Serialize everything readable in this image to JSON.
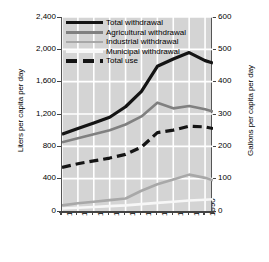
{
  "chart_data": {
    "type": "line",
    "title": "",
    "xlabel": "",
    "ylabel": "Liters per capita per day",
    "ylabel_right": "Gallons per capita per day",
    "x": [
      1900,
      1910,
      1920,
      1930,
      1940,
      1950,
      1960,
      1970,
      1980,
      1990,
      1995
    ],
    "xlim": [
      1900,
      1995
    ],
    "ylim": [
      0,
      2400
    ],
    "ylim_right": [
      0,
      600
    ],
    "xticks": [
      "1900",
      "1910",
      "1920",
      "1930",
      "1940",
      "1950",
      "1960",
      "1970",
      "1980",
      "1990"
    ],
    "yticks_left": [
      "0",
      "400",
      "800",
      "1,200",
      "1,600",
      "2,000",
      "2,400"
    ],
    "yticks_right": [
      "0",
      "100",
      "200",
      "300",
      "400",
      "500",
      "600"
    ],
    "grid": true,
    "grid_color": "#ffffff",
    "plot_background": "#d4d4d4",
    "legend_position": "top-left",
    "series": [
      {
        "name": "Total withdrawal",
        "color": "#141414",
        "style": "solid",
        "width": 3.2,
        "values": [
          950,
          1020,
          1090,
          1160,
          1290,
          1480,
          1790,
          1880,
          1960,
          1860,
          1830
        ]
      },
      {
        "name": "Agricultural withdrawal",
        "color": "#808080",
        "style": "solid",
        "width": 2.6,
        "values": [
          850,
          900,
          950,
          1000,
          1070,
          1170,
          1340,
          1270,
          1300,
          1260,
          1230
        ]
      },
      {
        "name": "Industrial withdrawal",
        "color": "#a8a8a8",
        "style": "solid",
        "width": 2.6,
        "values": [
          70,
          95,
          115,
          135,
          155,
          250,
          330,
          390,
          450,
          410,
          380
        ]
      },
      {
        "name": "Municipal withdrawal",
        "color": "#f7f7f7",
        "style": "solid",
        "width": 2.6,
        "values": [
          30,
          40,
          50,
          60,
          70,
          85,
          100,
          115,
          130,
          140,
          145
        ]
      },
      {
        "name": "Total use",
        "color": "#141414",
        "style": "dashed",
        "width": 3.2,
        "values": [
          540,
          585,
          620,
          655,
          700,
          790,
          970,
          1000,
          1050,
          1040,
          1020
        ]
      }
    ]
  },
  "legend": {
    "items": [
      {
        "label": "Total withdrawal"
      },
      {
        "label": "Agricultural withdrawal"
      },
      {
        "label": "Industrial withdrawal"
      },
      {
        "label": "Municipal withdrawal"
      },
      {
        "label": "Total use"
      }
    ]
  }
}
